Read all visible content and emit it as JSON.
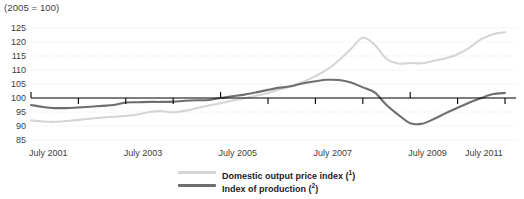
{
  "chart_data": {
    "type": "line",
    "title": "(2005 = 100)",
    "xlabel": "",
    "ylabel": "",
    "ylim": [
      85,
      125
    ],
    "yticks": [
      85,
      90,
      95,
      100,
      105,
      110,
      115,
      120,
      125
    ],
    "xlim": [
      2001.5,
      2011.5
    ],
    "xticks": [
      2001.5,
      2003.5,
      2005.5,
      2007.5,
      2009.5,
      2011.5
    ],
    "xticklabels": [
      "July 2001",
      "July 2003",
      "July 2005",
      "July 2007",
      "July 2009",
      "July 2011"
    ],
    "grid": true,
    "grid_style": "dotted",
    "baseline": 100,
    "legend_position": "bottom-center",
    "series": [
      {
        "name": "Domestic output price index",
        "footnote": "1",
        "color": "#d5d5d5",
        "x": [
          2001.5,
          2001.75,
          2002.0,
          2002.25,
          2002.5,
          2002.75,
          2003.0,
          2003.25,
          2003.5,
          2003.75,
          2004.0,
          2004.25,
          2004.5,
          2004.75,
          2005.0,
          2005.25,
          2005.5,
          2005.75,
          2006.0,
          2006.25,
          2006.5,
          2006.75,
          2007.0,
          2007.25,
          2007.5,
          2007.75,
          2008.0,
          2008.25,
          2008.5,
          2008.75,
          2009.0,
          2009.25,
          2009.5,
          2009.75,
          2010.0,
          2010.25,
          2010.5,
          2010.75,
          2011.0,
          2011.25,
          2011.5
        ],
        "values": [
          92.0,
          91.6,
          91.5,
          91.8,
          92.2,
          92.6,
          93.0,
          93.3,
          93.6,
          94.1,
          95.0,
          95.3,
          94.9,
          95.4,
          96.4,
          97.3,
          98.1,
          99.1,
          99.9,
          100.8,
          101.8,
          103.0,
          104.2,
          105.8,
          107.8,
          110.2,
          113.5,
          117.5,
          121.5,
          119.0,
          114.0,
          112.3,
          112.5,
          112.4,
          113.3,
          114.2,
          115.6,
          118.0,
          121.0,
          122.8,
          123.5
        ]
      },
      {
        "name": "Index of production",
        "footnote": "2",
        "color": "#6e6e6e",
        "x": [
          2001.5,
          2001.75,
          2002.0,
          2002.25,
          2002.5,
          2002.75,
          2003.0,
          2003.25,
          2003.5,
          2003.75,
          2004.0,
          2004.25,
          2004.5,
          2004.75,
          2005.0,
          2005.25,
          2005.5,
          2005.75,
          2006.0,
          2006.25,
          2006.5,
          2006.75,
          2007.0,
          2007.25,
          2007.5,
          2007.75,
          2008.0,
          2008.25,
          2008.5,
          2008.75,
          2009.0,
          2009.25,
          2009.5,
          2009.75,
          2010.0,
          2010.25,
          2010.5,
          2010.75,
          2011.0,
          2011.25,
          2011.5
        ],
        "values": [
          97.5,
          96.8,
          96.4,
          96.4,
          96.6,
          96.9,
          97.2,
          97.5,
          98.4,
          98.5,
          98.6,
          98.6,
          98.7,
          99.0,
          99.2,
          99.3,
          100.0,
          100.6,
          101.2,
          102.0,
          102.9,
          103.7,
          104.3,
          105.3,
          106.0,
          106.5,
          106.4,
          105.5,
          103.8,
          102.0,
          97.5,
          94.0,
          91.0,
          90.8,
          92.5,
          94.6,
          96.5,
          98.4,
          100.0,
          101.4,
          101.8
        ]
      }
    ]
  },
  "legend": {
    "items": [
      {
        "label": "Domestic output price index",
        "footnote": "1"
      },
      {
        "label": "Index of production",
        "footnote": "2"
      }
    ]
  }
}
